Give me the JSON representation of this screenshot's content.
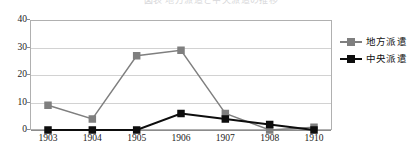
{
  "figure": {
    "top_clipped_caption": "図表  地方派遣と中央派遣の推移",
    "plot_background": "#ffffff",
    "frame_color": "#b0b0b0",
    "grid_color": "#d2d2d2"
  },
  "legend": {
    "position": "right",
    "entries": [
      {
        "label": "地方派遣",
        "color": "#7f7f7f",
        "marker": "square"
      },
      {
        "label": "中央派遣",
        "color": "#0d0d0d",
        "marker": "square"
      }
    ]
  },
  "chart_data": {
    "type": "line",
    "title": "",
    "subtitle": "",
    "xlabel": "",
    "ylabel": "",
    "categories": [
      "1903",
      "1904",
      "1905",
      "1906",
      "1907",
      "1908",
      "1910"
    ],
    "x_tick_labels": [
      "1903",
      "1904",
      "1905",
      "1906",
      "1907",
      "1908",
      "1910"
    ],
    "y_tick_labels": [
      "0",
      "10",
      "20",
      "30",
      "40"
    ],
    "y_ticks": [
      0,
      10,
      20,
      30,
      40
    ],
    "ylim": [
      0,
      40
    ],
    "grid": true,
    "grid_axis": "y",
    "legend_position": "right",
    "series": [
      {
        "name": "地方派遣",
        "color": "#7f7f7f",
        "marker": "square",
        "values": [
          9,
          4,
          27,
          29,
          6,
          0,
          1
        ]
      },
      {
        "name": "中央派遣",
        "color": "#0d0d0d",
        "marker": "square",
        "values": [
          0,
          0,
          0,
          6,
          4,
          2,
          0
        ]
      }
    ]
  }
}
